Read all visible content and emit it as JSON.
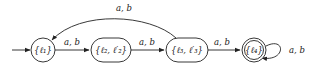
{
  "diagram": {
    "type": "finite-automaton",
    "states": [
      {
        "id": "s1",
        "label": "{ℓ₁}",
        "initial": true,
        "accepting": false,
        "shape": "circle"
      },
      {
        "id": "s2",
        "label": "{ℓ₂, ℓ′₂}",
        "initial": false,
        "accepting": false,
        "shape": "rounded-rect"
      },
      {
        "id": "s3",
        "label": "{ℓ₃, ℓ′₃}",
        "initial": false,
        "accepting": false,
        "shape": "rounded-rect"
      },
      {
        "id": "s4",
        "label": "{ℓ₄}",
        "initial": false,
        "accepting": true,
        "shape": "double-circle"
      }
    ],
    "transitions": [
      {
        "from": "s1",
        "to": "s2",
        "label": "a, b"
      },
      {
        "from": "s2",
        "to": "s3",
        "label": "a, b"
      },
      {
        "from": "s3",
        "to": "s4",
        "label": "a, b"
      },
      {
        "from": "s3",
        "to": "s1",
        "label": "a, b"
      },
      {
        "from": "s4",
        "to": "s4",
        "label": "a, b"
      }
    ]
  }
}
